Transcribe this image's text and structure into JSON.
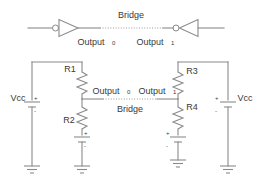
{
  "diagram": {
    "title_top": "Bridge",
    "title_bottom": "Bridge",
    "top_section": {
      "label_output0": "Output",
      "label_output0_sub": "0",
      "label_output1": "Output",
      "label_output1_sub": "1",
      "bridge_label": "Bridge",
      "gate_left_name": "inverter",
      "gate_right_name": "inverter"
    },
    "bottom_section": {
      "supply_left": "Vcc",
      "supply_right": "Vcc",
      "resistor_r1": "R1",
      "resistor_r2": "R2",
      "resistor_r3": "R3",
      "resistor_r4": "R4",
      "label_output0": "Output",
      "label_output0_sub": "0",
      "label_output1": "Output",
      "label_output1_sub": "1",
      "bridge_label": "Bridge",
      "battery_polarity_plus": "+",
      "battery_polarity_minus": "-"
    },
    "colors": {
      "wire": "#8a8a8a",
      "text": "#3a3a3a",
      "background": "#ffffff"
    }
  }
}
